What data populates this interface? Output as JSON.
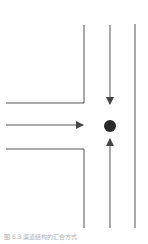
{
  "diagram": {
    "type": "flow-convergence",
    "colors": {
      "line": "#555555",
      "dot": "#2a2a2a",
      "caption": "#b0b0b0"
    },
    "flows": [
      {
        "id": "from-top",
        "direction": "down"
      },
      {
        "id": "from-left",
        "direction": "right"
      },
      {
        "id": "from-bottom",
        "direction": "up"
      }
    ],
    "node": {
      "id": "convergence-point",
      "shape": "dot"
    }
  },
  "caption": {
    "text": "图 6.3  渠道结构的汇合方式"
  }
}
